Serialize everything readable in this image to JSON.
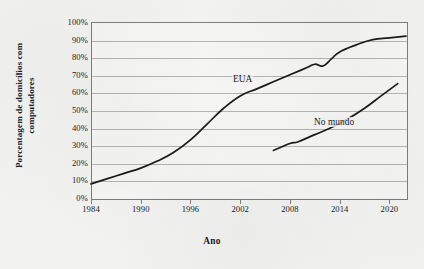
{
  "chart_data": {
    "type": "line",
    "title": "",
    "xlabel": "Ano",
    "ylabel": "Porcentagem de domicílios com computadores",
    "xlim": [
      1984,
      2022
    ],
    "ylim": [
      0,
      100
    ],
    "grid": true,
    "legend_position": "inline-annotation",
    "xticks": [
      "1984",
      "1990",
      "1996",
      "2002",
      "2008",
      "2014",
      "2020"
    ],
    "xtick_values": [
      1984,
      1990,
      1996,
      2002,
      2008,
      2014,
      2020
    ],
    "yticks": [
      "0%",
      "10%",
      "20%",
      "30%",
      "40%",
      "50%",
      "60%",
      "70%",
      "80%",
      "90%",
      "100%"
    ],
    "ytick_values": [
      0,
      10,
      20,
      30,
      40,
      50,
      60,
      70,
      80,
      90,
      100
    ],
    "series": [
      {
        "name": "EUA",
        "color": "#1a1a1a",
        "x": [
          1984,
          1986,
          1988,
          1990,
          1992,
          1994,
          1996,
          1998,
          2000,
          2002,
          2004,
          2006,
          2008,
          2010,
          2011,
          2012,
          2013,
          2014,
          2016,
          2018,
          2020,
          2022
        ],
        "values": [
          8,
          11,
          14,
          17,
          21,
          26,
          33,
          42,
          51,
          58,
          62,
          66,
          70,
          74,
          76,
          75,
          79,
          83,
          87,
          90,
          91,
          92
        ]
      },
      {
        "name": "No mundo",
        "color": "#1a1a1a",
        "x": [
          2006,
          2008,
          2009,
          2011,
          2013,
          2015,
          2017,
          2019,
          2021
        ],
        "values": [
          27,
          31,
          32,
          36,
          40,
          45,
          51,
          58,
          65
        ]
      }
    ],
    "annotations": [
      {
        "text": "EUA",
        "x": 2002,
        "y": 63
      },
      {
        "text": "No mundo",
        "x": 2013,
        "y": 42
      }
    ]
  },
  "axis": {
    "y_title": "Porcentagem de domicílios com",
    "y_title_line2": "computadores",
    "x_title": "Ano"
  },
  "colors": {
    "line": "#1a1a1a",
    "grid": "#b4b4b4",
    "frame": "#7d7d7d",
    "background": "#f2f2f1"
  }
}
